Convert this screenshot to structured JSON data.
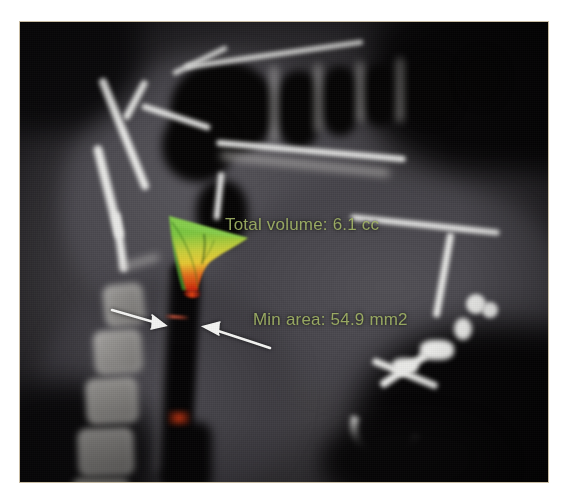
{
  "image": {
    "modality": "CBCT sagittal slice",
    "region": "upper airway / cephalometric"
  },
  "annotations": {
    "total_volume": {
      "label": "Total volume: 6.1 cc",
      "value": "6.1",
      "unit": "cc",
      "color": "#9fb163"
    },
    "min_area": {
      "label": "Min area: 54.9 mm2",
      "value": "54.9",
      "unit": "mm2",
      "color": "#9fb163"
    }
  },
  "markers": {
    "arrow_left": "left-pointer-arrow",
    "arrow_right": "right-pointer-arrow",
    "min_area_line": "minimum-cross-section-marker",
    "arrow_color": "#f2f2f2",
    "min_line_color": "#8c3a2a"
  },
  "airway_render": {
    "name": "airway-volume-colormap",
    "colors_top": "#6fbf3f",
    "colors_mid": "#e8d63c",
    "colors_bottom": "#d42a12",
    "scale_hint": "green = wide cross-section, red = narrow cross-section"
  },
  "frame": {
    "border_color": "#c9bda4",
    "background_color": "#050505"
  }
}
